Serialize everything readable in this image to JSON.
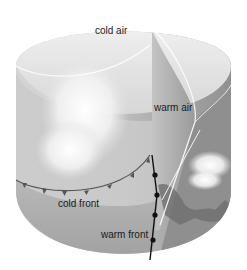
{
  "diagram": {
    "type": "weather-front-cutaway",
    "labels": {
      "cold_air": "cold air",
      "warm_air": "warm air",
      "cold_front": "cold front",
      "warm_front": "warm front"
    },
    "colors": {
      "background": "#ffffff",
      "cylinder_light": "#e6e6e6",
      "cylinder_mid": "#bdbdbd",
      "cylinder_dark": "#8c8c8c",
      "warm_air_wedge": "#a9a9a9",
      "cold_front_line": "#555555",
      "warm_front_line": "#111111",
      "cloud": "#f7f7f7"
    }
  }
}
